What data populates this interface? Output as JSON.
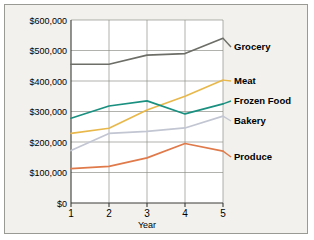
{
  "chart_data": {
    "type": "line",
    "title": "",
    "xlabel": "Year",
    "ylabel": "",
    "x": [
      1,
      2,
      3,
      4,
      5
    ],
    "categories": [
      "1",
      "2",
      "3",
      "4",
      "5"
    ],
    "xtick_labels": [
      "1",
      "2",
      "3",
      "4",
      "5"
    ],
    "ytick_labels": [
      "$0",
      "$100,000",
      "$200,000",
      "$300,000",
      "$400,000",
      "$500,000",
      "$600,000"
    ],
    "ytick_values": [
      0,
      100000,
      200000,
      300000,
      400000,
      500000,
      600000
    ],
    "ylim": [
      0,
      600000
    ],
    "xlim": [
      1,
      5
    ],
    "grid": true,
    "legend_position": "right-inline-labels",
    "series": [
      {
        "name": "Grocery",
        "color": "#6e6e68",
        "values": [
          455000,
          455000,
          485000,
          490000,
          540000
        ]
      },
      {
        "name": "Meat",
        "color": "#e8b84b",
        "values": [
          228000,
          245000,
          305000,
          350000,
          403000
        ]
      },
      {
        "name": "Frozen Food",
        "color": "#1a9080",
        "values": [
          278000,
          318000,
          335000,
          292000,
          325000
        ]
      },
      {
        "name": "Bakery",
        "color": "#c2c6d2",
        "values": [
          172000,
          228000,
          235000,
          246000,
          285000
        ]
      },
      {
        "name": "Produce",
        "color": "#e07a4a",
        "values": [
          113000,
          120000,
          148000,
          195000,
          170000
        ]
      }
    ]
  },
  "labels": {
    "grocery": "Grocery",
    "meat": "Meat",
    "frozen_food": "Frozen Food",
    "bakery": "Bakery",
    "produce": "Produce",
    "x_axis_title": "Year",
    "y0": "$0",
    "y1": "$100,000",
    "y2": "$200,000",
    "y3": "$300,000",
    "y4": "$400,000",
    "y5": "$500,000",
    "y6": "$600,000",
    "x1": "1",
    "x2": "2",
    "x3": "3",
    "x4": "4",
    "x5": "5"
  },
  "colors": {
    "grocery": "#6e6e68",
    "meat": "#e8b84b",
    "frozen_food": "#1a9080",
    "bakery": "#c2c6d2",
    "produce": "#e07a4a",
    "background": "#f2f1ed",
    "grid": "#8f8f8a",
    "axis": "#3a3a38",
    "border": "#9a9a94"
  }
}
